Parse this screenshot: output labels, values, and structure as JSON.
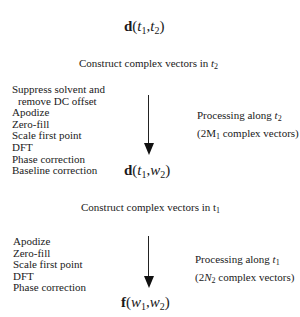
{
  "nodes": {
    "top": {
      "prefix": "d",
      "open": "(",
      "a": "t",
      "a_sub": "1",
      "sep": ",",
      "b": "t",
      "b_sub": "2",
      "close": ")"
    },
    "middle": {
      "prefix": "d",
      "open": "(",
      "a": "t",
      "a_sub": "1",
      "sep": ",",
      "b": "w",
      "b_sub": "2",
      "close": ")"
    },
    "bottom": {
      "prefix": "f",
      "open": "(",
      "a": "w",
      "a_sub": "1",
      "sep": ",",
      "b": "w",
      "b_sub": "2",
      "close": ")"
    }
  },
  "captions": {
    "stage1": {
      "text": "Construct complex vectors in ",
      "var": "t",
      "sub": "2"
    },
    "stage2": {
      "text": "Construct complex vectors in t",
      "sub": "1"
    }
  },
  "stage1": {
    "steps": [
      "Suppress solvent and",
      "remove DC offset",
      "Apodize",
      "Zero-fill",
      "Scale first point",
      "DFT",
      "Phase correction",
      "Baseline correction"
    ],
    "side_line1": "Processing along ",
    "side_var": "t",
    "side_sub": "2",
    "side_line2_pre": "(2M",
    "side_line2_sub": "1",
    "side_line2_post": " complex vectors)"
  },
  "stage2": {
    "steps": [
      "Apodize",
      "Zero-fill",
      "Scale first point",
      "DFT",
      "Phase correction"
    ],
    "side_line1": "Processing along ",
    "side_var": "t",
    "side_sub": "1",
    "side_line2_pre": "(2",
    "side_line2_var": "N",
    "side_line2_sub": "2",
    "side_line2_post": " complex vectors)"
  }
}
